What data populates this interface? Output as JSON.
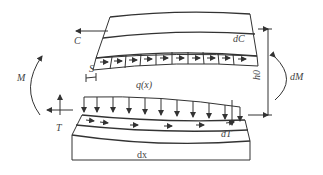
{
  "diagram": {
    "type": "curved-beam-element-free-body",
    "labels": {
      "compression_force": "C",
      "compression_increment": "dC",
      "moment": "M",
      "moment_increment": "dM",
      "shear_slip": "S",
      "distributed_load": "q(x)",
      "tension_force": "T",
      "tension_increment": "dT",
      "lever_arm": "h0",
      "element_length": "dx"
    },
    "colors": {
      "line": "#333333",
      "text": "#444444",
      "background": "#ffffff"
    }
  }
}
